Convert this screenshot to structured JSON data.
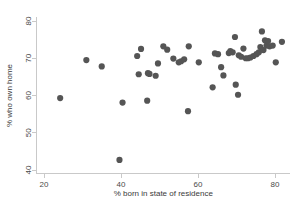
{
  "chart_data": {
    "type": "scatter",
    "title": "",
    "xlabel": "% born in state of residence",
    "ylabel": "% who own home",
    "xlim": [
      18,
      84
    ],
    "ylim": [
      39,
      81
    ],
    "xticks": [
      20,
      40,
      60,
      80
    ],
    "yticks": [
      40,
      50,
      60,
      70,
      80
    ],
    "xtick_labels": [
      "20",
      "40",
      "60",
      "80"
    ],
    "ytick_labels": [
      "40",
      "50",
      "60",
      "70",
      "80"
    ],
    "grid": false,
    "legend": "none",
    "marker_color": "#555555",
    "marker_size": 3.1,
    "axis_color": "#c9c9c9",
    "background": "#ffffff",
    "series": [
      {
        "name": "states",
        "points": [
          [
            24.2,
            59.3
          ],
          [
            31.0,
            69.5
          ],
          [
            35.0,
            67.8
          ],
          [
            39.6,
            42.7
          ],
          [
            40.4,
            58.1
          ],
          [
            44.2,
            70.6
          ],
          [
            44.6,
            65.7
          ],
          [
            45.2,
            72.5
          ],
          [
            46.8,
            58.6
          ],
          [
            47.0,
            66.0
          ],
          [
            47.4,
            65.8
          ],
          [
            49.0,
            65.3
          ],
          [
            49.6,
            68.6
          ],
          [
            51.0,
            73.2
          ],
          [
            52.0,
            72.3
          ],
          [
            53.6,
            69.9
          ],
          [
            55.0,
            68.9
          ],
          [
            55.6,
            69.2
          ],
          [
            56.4,
            69.7
          ],
          [
            57.4,
            55.8
          ],
          [
            57.6,
            73.2
          ],
          [
            60.2,
            68.9
          ],
          [
            63.8,
            62.2
          ],
          [
            64.4,
            71.3
          ],
          [
            65.2,
            71.1
          ],
          [
            66.0,
            67.6
          ],
          [
            66.6,
            65.4
          ],
          [
            68.0,
            71.4
          ],
          [
            68.4,
            71.9
          ],
          [
            69.0,
            71.6
          ],
          [
            69.6,
            75.7
          ],
          [
            69.8,
            62.9
          ],
          [
            70.4,
            60.2
          ],
          [
            70.6,
            70.8
          ],
          [
            71.2,
            70.4
          ],
          [
            71.8,
            72.6
          ],
          [
            72.4,
            70.0
          ],
          [
            73.0,
            70.0
          ],
          [
            73.6,
            70.2
          ],
          [
            74.4,
            70.6
          ],
          [
            75.2,
            71.1
          ],
          [
            75.8,
            71.6
          ],
          [
            76.2,
            73.0
          ],
          [
            76.6,
            77.2
          ],
          [
            77.0,
            72.2
          ],
          [
            77.4,
            74.8
          ],
          [
            77.8,
            73.4
          ],
          [
            78.2,
            74.6
          ],
          [
            78.6,
            73.2
          ],
          [
            79.4,
            73.4
          ],
          [
            80.2,
            68.9
          ],
          [
            81.8,
            74.4
          ]
        ]
      }
    ]
  }
}
